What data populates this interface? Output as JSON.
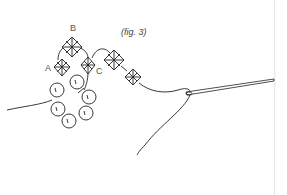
{
  "figure": {
    "caption": "(fig. 3)",
    "labels": {
      "a": "A",
      "b": "B",
      "c": "C"
    },
    "round_bead_count": 7,
    "bicone_count": 5,
    "ink_color": "#222222",
    "label_color": "#555555",
    "divider_color": "#e6e6e6"
  }
}
